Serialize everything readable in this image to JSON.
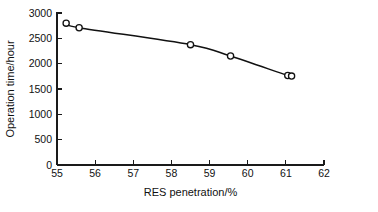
{
  "chart_data": {
    "type": "line",
    "title": "",
    "subtitle": "",
    "xlabel": "RES penetration/%",
    "ylabel": "Operation time/hour",
    "xlim": [
      55,
      62
    ],
    "ylim": [
      0,
      3000
    ],
    "xticks": [
      55,
      56,
      57,
      58,
      59,
      60,
      61,
      62
    ],
    "yticks": [
      0,
      500,
      1000,
      1500,
      2000,
      2500,
      3000
    ],
    "xtick_labels": [
      "55",
      "56",
      "57",
      "58",
      "59",
      "60",
      "61",
      "62"
    ],
    "ytick_labels": [
      "0",
      "500",
      "1000",
      "1500",
      "2000",
      "2500",
      "3000"
    ],
    "grid": false,
    "legend": null,
    "marker": "circle-open",
    "line_color": "#111111",
    "marker_face_color": "#ffffff",
    "marker_edge_color": "#111111",
    "series": [
      {
        "name": "Operation time",
        "x": [
          55.24,
          55.58,
          58.5,
          59.55,
          61.05,
          61.15
        ],
        "y": [
          2800,
          2710,
          2375,
          2150,
          1765,
          1755
        ]
      }
    ],
    "annotations": []
  },
  "figure": {
    "background": "#ffffff",
    "axis_color": "#1a1a1a"
  }
}
